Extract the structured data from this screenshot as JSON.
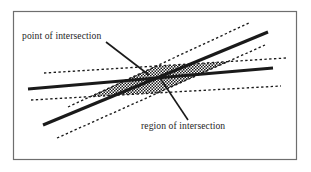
{
  "figure": {
    "title": "",
    "background_color": "#ffffff",
    "frame": {
      "stroke_color": "#6e6e6e",
      "x": 13,
      "y": 11,
      "width": 284,
      "height": 149
    },
    "annotations": [
      {
        "id": "point-of-intersection",
        "text": "point of intersection",
        "text_x": 22,
        "text_y": 39,
        "leader_from_x": 106,
        "leader_from_y": 42,
        "leader_to_x": 149,
        "leader_to_y": 75
      },
      {
        "id": "region-of-intersection",
        "text": "region of intersection",
        "text_x": 141,
        "text_y": 129,
        "leader_from_x": 188,
        "leader_from_y": 120,
        "leader_to_x": 160,
        "leader_to_y": 78
      }
    ],
    "solid_lines": {
      "stroke_color": "#1a1a1a",
      "stroke_width": 3.1,
      "count": 2,
      "items": [
        {
          "id": "line-a",
          "x1": 28,
          "y1": 89,
          "x2": 273,
          "y2": 68
        },
        {
          "id": "line-b",
          "x1": 43,
          "y1": 125,
          "x2": 268,
          "y2": 32
        }
      ]
    },
    "dashed_bands": {
      "stroke_color": "#1a1a1a",
      "stroke_width": 1.35,
      "dash_pattern": "2.4 2.4",
      "count": 4,
      "items": [
        {
          "id": "band-a-upper",
          "x1": 44,
          "y1": 73,
          "x2": 286,
          "y2": 58
        },
        {
          "id": "band-a-lower",
          "x1": 31,
          "y1": 100,
          "x2": 281,
          "y2": 86
        },
        {
          "id": "band-b-upper",
          "x1": 68,
          "y1": 107,
          "x2": 249,
          "y2": 23
        },
        {
          "id": "band-b-lower",
          "x1": 57,
          "y1": 138,
          "x2": 265,
          "y2": 45
        }
      ]
    },
    "intersection_region": {
      "id": "hatched-overlap",
      "pattern": "checkerboard",
      "pattern_color": "#1a1a1a",
      "description": "overlap of the two dashed confidence bands"
    },
    "intersection_point": {
      "id": "crossing-point",
      "x": 152,
      "y": 77
    }
  }
}
